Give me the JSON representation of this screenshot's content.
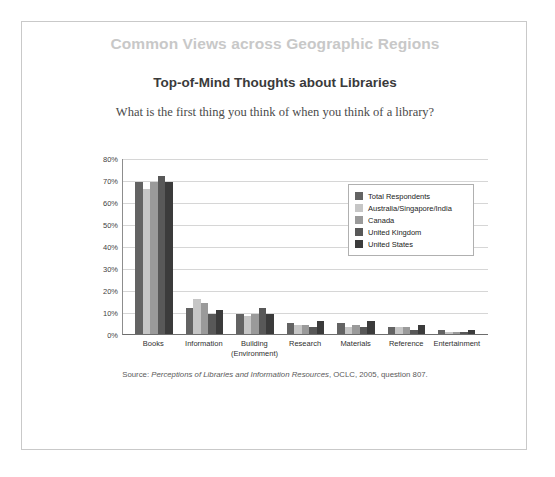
{
  "section_title": "Common Views across Geographic Regions",
  "chart_title": "Top-of-Mind Thoughts about Libraries",
  "chart_subtitle": "What is the first thing you think of when you think of a library?",
  "source": {
    "prefix": "Source:",
    "italic": "Perceptions of Libraries and Information Resources",
    "suffix": ", OCLC, 2005, question 807."
  },
  "chart_data": {
    "type": "bar",
    "title": "Top-of-Mind Thoughts about Libraries",
    "subtitle": "What is the first thing you think of when you think of a library?",
    "xlabel": "",
    "ylabel": "",
    "ylim": [
      0,
      80
    ],
    "ytick_values": [
      0,
      10,
      20,
      30,
      40,
      50,
      60,
      70,
      80
    ],
    "ytick_labels": [
      "0%",
      "10%",
      "20%",
      "30%",
      "40%",
      "50%",
      "60%",
      "70%",
      "80%"
    ],
    "grid": true,
    "legend_position": "upper-right-inside",
    "categories": [
      "Books",
      "Information",
      "Building (Environment)",
      "Research",
      "Materials",
      "Reference",
      "Entertainment"
    ],
    "category_labels": [
      {
        "line1": "Books",
        "line2": ""
      },
      {
        "line1": "Information",
        "line2": ""
      },
      {
        "line1": "Building",
        "line2": "(Environment)"
      },
      {
        "line1": "Research",
        "line2": ""
      },
      {
        "line1": "Materials",
        "line2": ""
      },
      {
        "line1": "Reference",
        "line2": ""
      },
      {
        "line1": "Entertainment",
        "line2": ""
      }
    ],
    "series": [
      {
        "name": "Total Respondents",
        "color": "#636363",
        "values": [
          69,
          12,
          9,
          5,
          5,
          3,
          2
        ]
      },
      {
        "name": "Australia/Singapore/India",
        "color": "#c6c6c6",
        "values": [
          66,
          16,
          8,
          4,
          3,
          3,
          1
        ]
      },
      {
        "name": "Canada",
        "color": "#9a9a9a",
        "values": [
          69,
          14,
          9,
          4,
          4,
          3,
          1
        ]
      },
      {
        "name": "United Kingdom",
        "color": "#585858",
        "values": [
          72,
          9,
          12,
          3,
          3,
          2,
          1
        ]
      },
      {
        "name": "United States",
        "color": "#3b3b3b",
        "values": [
          69,
          11,
          9,
          6,
          6,
          4,
          2
        ]
      }
    ]
  }
}
